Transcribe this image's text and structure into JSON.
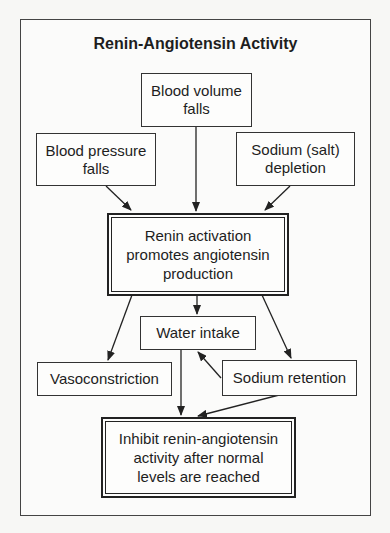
{
  "diagram": {
    "title": "Renin-Angiotensin Activity",
    "nodes": {
      "blood_volume": "Blood volume falls",
      "blood_pressure": "Blood pressure falls",
      "sodium_depletion": "Sodium (salt) depletion",
      "renin": "Renin activation promotes angiotensin production",
      "water_intake": "Water intake",
      "vasoconstriction": "Vasoconstriction",
      "sodium_retention": "Sodium retention",
      "inhibit": "Inhibit renin-angiotensin activity after normal levels are reached"
    },
    "edges": [
      {
        "from": "blood_volume",
        "to": "renin"
      },
      {
        "from": "blood_pressure",
        "to": "renin"
      },
      {
        "from": "sodium_depletion",
        "to": "renin"
      },
      {
        "from": "renin",
        "to": "water_intake"
      },
      {
        "from": "renin",
        "to": "vasoconstriction"
      },
      {
        "from": "renin",
        "to": "sodium_retention"
      },
      {
        "from": "sodium_retention",
        "to": "water_intake"
      },
      {
        "from": "water_intake",
        "to": "inhibit"
      },
      {
        "from": "sodium_retention",
        "to": "inhibit"
      }
    ]
  }
}
